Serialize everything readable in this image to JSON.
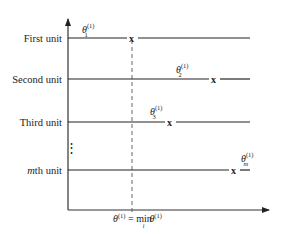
{
  "diagram": {
    "units": [
      {
        "label": "First unit",
        "y": 38,
        "x_mark": 132,
        "theta_label": "θ",
        "theta_sup": "(1)",
        "theta_sub": "1",
        "label_x": 82,
        "label_y": 30,
        "line_end": 250
      },
      {
        "label": "Second unit",
        "y": 79,
        "x_mark": 214,
        "theta_label": "θ",
        "theta_sup": "(1)",
        "theta_sub": "2",
        "label_x": 176,
        "label_y": 70,
        "line_end": 250
      },
      {
        "label": "Third unit",
        "y": 122,
        "x_mark": 170,
        "theta_label": "θ",
        "theta_sup": "(1)",
        "theta_sub": "3",
        "label_x": 150,
        "label_y": 113,
        "line_end": 250
      },
      {
        "label": "mth unit",
        "label_italic_prefix": "m",
        "label_rest": "th unit",
        "y": 170,
        "x_mark": 234,
        "theta_label": "θ",
        "theta_sup": "(1)",
        "theta_sub": "m",
        "label_x": 241,
        "label_y": 159,
        "line_end": 250
      }
    ],
    "ellipsis": "⋮",
    "mark_glyph": "x",
    "min_label": {
      "theta": "θ",
      "sup": "(1)",
      "equals": " = ",
      "min": "min",
      "min_sub": "i",
      "theta2": "θ",
      "sup2": "(1)"
    },
    "axis": {
      "origin_x": 68,
      "origin_y": 210,
      "y_top": 18,
      "x_right": 270
    },
    "dashed_x": 132,
    "colors": {
      "line": "#222222",
      "text": "#222222",
      "dashed": "#555555",
      "background": "#ffffff"
    }
  }
}
